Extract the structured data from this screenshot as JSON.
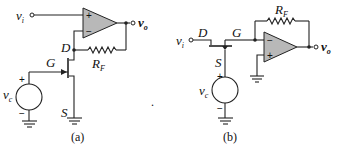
{
  "figure": {
    "circuits": [
      {
        "id": "a",
        "caption": "(a)",
        "labels": {
          "input": "v",
          "input_sub": "i",
          "output": "v",
          "output_sub": "o",
          "drain": "D",
          "gate": "G",
          "source": "S",
          "resistor": "R",
          "resistor_sub": "F",
          "control": "v",
          "control_sub": "c",
          "opamp_plus": "+",
          "opamp_minus": "−",
          "src_plus": "+",
          "src_minus": "−"
        }
      },
      {
        "id": "b",
        "caption": "(b)",
        "labels": {
          "input": "v",
          "input_sub": "i",
          "output": "v",
          "output_sub": "o",
          "drain": "D",
          "gate": "G",
          "source": "S",
          "resistor": "R",
          "resistor_sub": "F",
          "control": "v",
          "control_sub": "c",
          "opamp_plus": "+",
          "opamp_minus": "−",
          "src_plus": "+",
          "src_minus": "−"
        }
      }
    ],
    "stray_mark": "."
  },
  "colors": {
    "opamp_fill": "#b8b8b8",
    "wire": "#222222"
  }
}
